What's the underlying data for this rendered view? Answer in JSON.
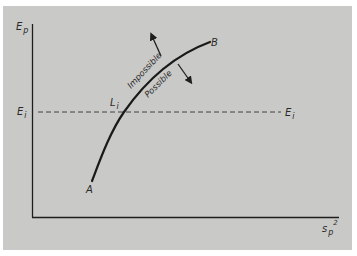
{
  "diagram": {
    "background_color": "#c9c9c7",
    "line_color": "#1e1e1e",
    "y_axis": {
      "label": "E",
      "subscript": "p"
    },
    "x_axis": {
      "label": "s",
      "subscript": "p",
      "superscript": "2"
    },
    "reference_line": {
      "left_label": "E",
      "left_subscript": "i",
      "right_label": "E",
      "right_subscript": "i",
      "style": "dashed"
    },
    "curve": {
      "start_label": "A",
      "end_label": "B",
      "intersection_label": "L",
      "intersection_subscript": "i"
    },
    "regions": {
      "above": {
        "text": "Impossible",
        "arrow": "arrow-up-left"
      },
      "below": {
        "text": "Possible",
        "arrow": "arrow-down-right"
      }
    }
  }
}
